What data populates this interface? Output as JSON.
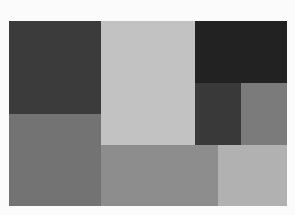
{
  "canvas": {
    "width": 295,
    "height": 215,
    "background": "#fbfbfb"
  },
  "blocks": [
    {
      "id": "top-left",
      "x": 9,
      "y": 21,
      "w": 92,
      "h": 93,
      "color": "#3b3b3b"
    },
    {
      "id": "top-center",
      "x": 101,
      "y": 21,
      "w": 94,
      "h": 124,
      "color": "#c2c2c2"
    },
    {
      "id": "top-right",
      "x": 195,
      "y": 21,
      "w": 92,
      "h": 62,
      "color": "#222222"
    },
    {
      "id": "mid-right-left",
      "x": 195,
      "y": 83,
      "w": 46,
      "h": 62,
      "color": "#393939"
    },
    {
      "id": "mid-right-right",
      "x": 241,
      "y": 83,
      "w": 46,
      "h": 62,
      "color": "#7b7b7b"
    },
    {
      "id": "bottom-left",
      "x": 9,
      "y": 114,
      "w": 92,
      "h": 92,
      "color": "#737373"
    },
    {
      "id": "bottom-center",
      "x": 101,
      "y": 145,
      "w": 117,
      "h": 61,
      "color": "#8d8d8d"
    },
    {
      "id": "bottom-right",
      "x": 218,
      "y": 145,
      "w": 69,
      "h": 61,
      "color": "#b1b1b1"
    }
  ]
}
